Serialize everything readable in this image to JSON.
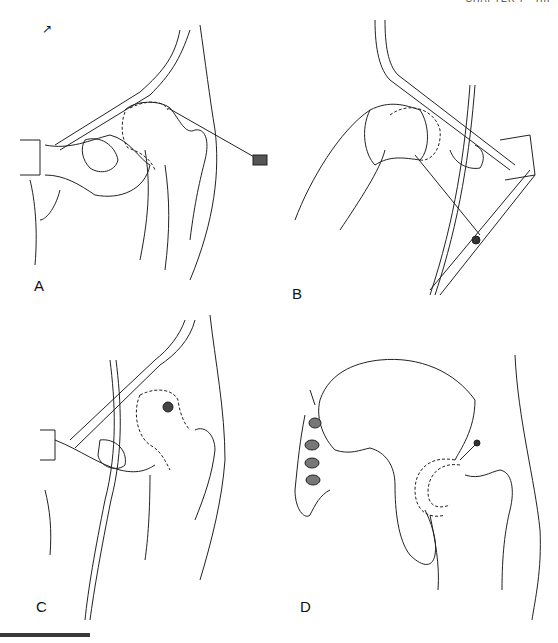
{
  "page": {
    "running_head": "CHAPTER 7  ·  HIP",
    "corner_mark": "↗"
  },
  "figure": {
    "panels": [
      {
        "id": "A",
        "label": "A",
        "description": "Hip joint, anterior view; needle inserted laterally into capsule (dashed outline)"
      },
      {
        "id": "B",
        "label": "B",
        "description": "Hip joint, alternate angle; needle directed obliquely beneath ligament"
      },
      {
        "id": "C",
        "label": "C",
        "description": "Hip joint, anterior view with vessel; needle hub over femoral head"
      },
      {
        "id": "D",
        "label": "D",
        "description": "Pelvis and proximal femur; needle entering superior capsule"
      }
    ]
  },
  "colors": {
    "line": "#222222",
    "rule": "#3a3a3a"
  }
}
